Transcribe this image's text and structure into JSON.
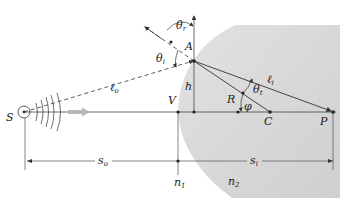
{
  "figure": {
    "labels": {
      "source": "S",
      "vertex": "V",
      "point_a": "A",
      "height": "h",
      "radius": "R",
      "center": "C",
      "image_point": "P",
      "angle_incidence": "θ",
      "angle_incidence_sub": "i",
      "angle_reflection": "θ",
      "angle_reflection_sub": "r",
      "angle_transmission": "θ",
      "angle_transmission_sub": "t",
      "angle_phi": "φ",
      "object_path": "ℓ",
      "object_path_sub": "o",
      "image_path": "ℓ",
      "image_path_sub": "i",
      "object_distance": "s",
      "object_distance_sub": "o",
      "image_distance": "s",
      "image_distance_sub": "i",
      "medium_1": "n",
      "medium_1_sub": "1",
      "medium_2": "n",
      "medium_2_sub": "2"
    },
    "colors": {
      "medium_2_fill": "#d4d4d4",
      "line": "#333333",
      "arrow_gray": "#b8b8b8"
    }
  }
}
